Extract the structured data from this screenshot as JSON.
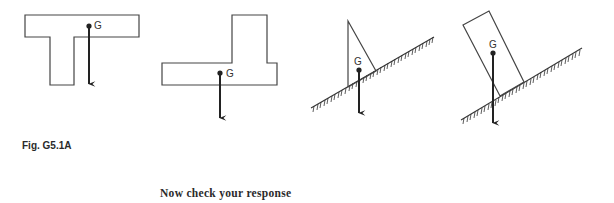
{
  "figure": {
    "caption": "Fig. G5.1A",
    "colors": {
      "line": "#333333",
      "arrow": "#222222",
      "background": "#ffffff"
    },
    "panels": [
      {
        "id": "t-shape",
        "shape": "T-shaped body",
        "label": "G",
        "resting_on_slope": false
      },
      {
        "id": "l-shape",
        "shape": "L-shaped body",
        "label": "G",
        "resting_on_slope": false
      },
      {
        "id": "triangle-on-slope",
        "shape": "right triangle on inclined plane",
        "label": "G",
        "resting_on_slope": true
      },
      {
        "id": "block-on-slope",
        "shape": "tilted rectangular block on inclined plane",
        "label": "G",
        "resting_on_slope": true
      }
    ]
  },
  "footer": {
    "prompt": "Now check your response"
  }
}
